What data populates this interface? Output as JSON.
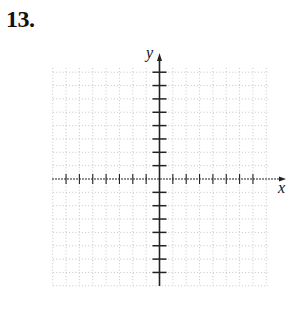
{
  "problem": {
    "number": "13."
  },
  "graph": {
    "x_label": "x",
    "y_label": "y",
    "origin": [
      159.5,
      179
    ],
    "tick_spacing_px": 13.35,
    "x_ticks_left": 7,
    "x_ticks_right": 7,
    "y_ticks_above": 8,
    "y_ticks_below": 7,
    "grid_extent": {
      "left": 53,
      "right": 268,
      "top": 68,
      "bottom": 286
    },
    "axis_color": "#222222",
    "grid_color": "#b8b8b8"
  },
  "chart_data": {
    "type": "scatter",
    "title": "",
    "xlabel": "x",
    "ylabel": "y",
    "xlim": [
      -8,
      8
    ],
    "ylim": [
      -8,
      8
    ],
    "grid": true,
    "series": []
  }
}
